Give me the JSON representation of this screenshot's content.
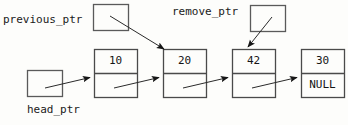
{
  "diagram": {
    "background_color": "#fdfdfb",
    "stroke_color": "#4a4a4a",
    "text_color": "#151515",
    "labels": {
      "previous_ptr": "previous_ptr",
      "remove_ptr": "remove_ptr",
      "head_ptr": "head_ptr"
    },
    "pointer_boxes": [
      {
        "name": "previous_ptr",
        "label": "previous_ptr",
        "x": 93,
        "y": 4,
        "w": 35,
        "h": 26,
        "label_x": 4,
        "label_y": 13
      },
      {
        "name": "remove_ptr",
        "label": "remove_ptr",
        "x": 250,
        "y": 5,
        "w": 35,
        "h": 26,
        "label_x": 172,
        "label_y": 5
      },
      {
        "name": "head_ptr",
        "label": "head_ptr",
        "x": 27,
        "y": 70,
        "w": 35,
        "h": 26,
        "label_x": 27,
        "label_y": 103
      }
    ],
    "nodes": [
      {
        "name": "node-10",
        "value": "10",
        "next": "",
        "x": 94,
        "y": 49,
        "w": 43,
        "h": 48
      },
      {
        "name": "node-20",
        "value": "20",
        "next": "",
        "x": 163,
        "y": 49,
        "w": 43,
        "h": 48
      },
      {
        "name": "node-42",
        "value": "42",
        "next": "",
        "x": 232,
        "y": 49,
        "w": 43,
        "h": 48
      },
      {
        "name": "node-30",
        "value": "30",
        "next": "NULL",
        "x": 301,
        "y": 49,
        "w": 43,
        "h": 48
      }
    ],
    "arrows": [
      {
        "name": "arrow-head-ptr-to-node-10",
        "x1": 45,
        "y1": 88,
        "x2": 92,
        "y2": 77
      },
      {
        "name": "arrow-node-10-to-node-20",
        "x1": 113,
        "y1": 88,
        "x2": 161,
        "y2": 77
      },
      {
        "name": "arrow-node-20-to-node-42",
        "x1": 182,
        "y1": 88,
        "x2": 230,
        "y2": 77
      },
      {
        "name": "arrow-node-42-to-node-30",
        "x1": 251,
        "y1": 88,
        "x2": 299,
        "y2": 77
      },
      {
        "name": "arrow-previous-ptr-to-node-20",
        "x1": 110,
        "y1": 16,
        "x2": 166,
        "y2": 49
      },
      {
        "name": "arrow-remove-ptr-to-node-42",
        "x1": 272,
        "y1": 17,
        "x2": 247,
        "y2": 47
      }
    ]
  }
}
